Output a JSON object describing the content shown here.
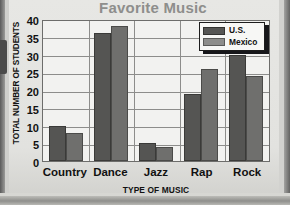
{
  "chart_data": {
    "type": "bar",
    "title": "Favorite Music",
    "xlabel": "TYPE OF MUSIC",
    "ylabel": "TOTAL NUMBER OF STUDENTS",
    "categories": [
      "Country",
      "Dance",
      "Jazz",
      "Rap",
      "Rock"
    ],
    "series": [
      {
        "name": "U.S.",
        "values": [
          10,
          36,
          5,
          19,
          30
        ],
        "color": "#555553"
      },
      {
        "name": "Mexico",
        "values": [
          8,
          38,
          4,
          26,
          24
        ],
        "color": "#6f6f6d"
      }
    ],
    "ylim": [
      0,
      40
    ],
    "yticks": [
      0,
      5,
      10,
      15,
      20,
      25,
      30,
      35,
      40
    ],
    "ytick_labels": [
      "0",
      "5",
      "10",
      "15",
      "20",
      "25",
      "30",
      "35",
      "40"
    ],
    "grid": true,
    "legend_position": "top-right",
    "title_color": "#8e8e8c"
  }
}
